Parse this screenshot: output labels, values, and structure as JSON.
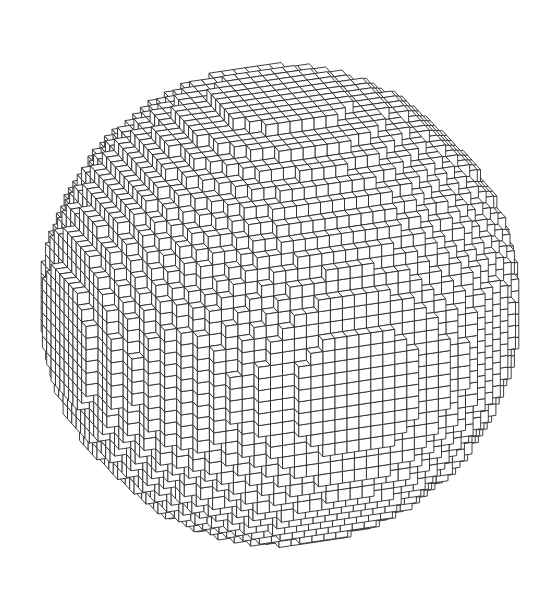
{
  "figure": {
    "background": "#ffffff",
    "face_color": "#ffffff",
    "edge_color": "#2a2a2a",
    "center": [
      280,
      305
    ],
    "radius_px": 245,
    "voxel_grid_radius": 18
  }
}
